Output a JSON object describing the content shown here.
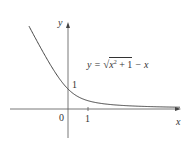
{
  "chart_data": {
    "type": "line",
    "title": "",
    "equation_label": "y = √(x² + 1) − x",
    "xlabel": "x",
    "ylabel": "y",
    "x_ticks": [
      {
        "value": 0,
        "label": "0"
      },
      {
        "value": 1,
        "label": "1"
      }
    ],
    "y_ticks": [
      {
        "value": 1,
        "label": "1"
      }
    ],
    "xlim": [
      -3.1,
      5.9
    ],
    "ylim": [
      -1.6,
      3.5
    ],
    "grid": false,
    "series": [
      {
        "name": "y = sqrt(x^2+1) - x",
        "x": [
          -1.95,
          -1.5,
          -1.0,
          -0.5,
          0,
          0.5,
          1.0,
          1.5,
          2.0,
          3.0,
          4.0,
          5.0,
          5.9
        ],
        "y": [
          4.14,
          3.3,
          2.41,
          1.62,
          1.0,
          0.62,
          0.41,
          0.3,
          0.24,
          0.16,
          0.12,
          0.1,
          0.08
        ]
      }
    ]
  },
  "labels": {
    "y_axis": "y",
    "x_axis": "x",
    "origin": "0",
    "x_tick_1": "1",
    "y_tick_1": "1",
    "eq_lhs": "y = ",
    "eq_radicand_x": "x",
    "eq_sup": "2",
    "eq_plus1": " + 1",
    "eq_tail": " − x"
  }
}
